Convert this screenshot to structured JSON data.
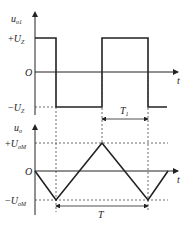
{
  "top_plot": {
    "y_axis_label": "u",
    "y_axis_sub": "o1",
    "x_axis_label": "t",
    "origin_label": "O",
    "pos_level_sign": "+",
    "pos_level_label": "U",
    "pos_level_sub": "Z",
    "neg_level_sign": "−",
    "neg_level_label": "U",
    "neg_level_sub": "Z",
    "interval_label": "T",
    "interval_sub": "1",
    "waveform": "square"
  },
  "bottom_plot": {
    "y_axis_label": "u",
    "y_axis_sub": "o",
    "x_axis_label": "t",
    "origin_label": "O",
    "pos_level_sign": "+",
    "pos_level_label": "U",
    "pos_level_sub": "oM",
    "neg_level_sign": "−",
    "neg_level_label": "U",
    "neg_level_sub": "oM",
    "period_label": "T",
    "waveform": "triangle"
  },
  "colors": {
    "line": "#222222",
    "dashed": "#444444"
  }
}
